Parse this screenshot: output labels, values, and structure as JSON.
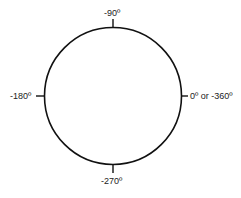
{
  "diagram": {
    "title": "",
    "shape": "circle",
    "colors": {
      "stroke": "#111111",
      "text": "#222222",
      "background": "#ffffff"
    },
    "labels": {
      "top": "-90º",
      "right": "0º or -360º",
      "bottom": "-270º",
      "left": "-180º"
    }
  }
}
